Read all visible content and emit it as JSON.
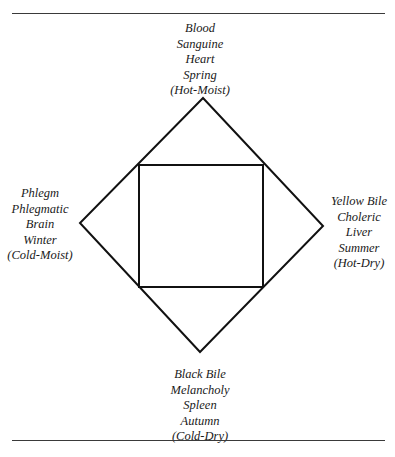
{
  "diagram": {
    "shape": "diamond-with-inscribed-square",
    "nodes": {
      "top": {
        "lines": [
          "Blood",
          "Sanguine",
          "Heart",
          "Spring",
          "(Hot-Moist)"
        ]
      },
      "left": {
        "lines": [
          "Phlegm",
          "Phlegmatic",
          "Brain",
          "Winter",
          "(Cold-Moist)"
        ]
      },
      "right": {
        "lines": [
          "Yellow Bile",
          "Choleric",
          "Liver",
          "Summer",
          "(Hot-Dry)"
        ]
      },
      "bottom": {
        "lines": [
          "Black Bile",
          "Melancholy",
          "Spleen",
          "Autumn",
          "(Cold-Dry)"
        ]
      }
    },
    "colors": {
      "stroke": "#111111",
      "text": "#1a1a1a",
      "rule": "#3a3a3a",
      "background": "#ffffff"
    }
  }
}
